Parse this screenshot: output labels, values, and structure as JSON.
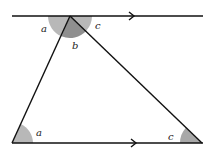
{
  "diagram": {
    "type": "geometry-parallel-lines-triangle",
    "colors": {
      "line": "#111111",
      "angle_light": "#b8b8b8",
      "angle_dark": "#8f8f8f",
      "background": "#ffffff"
    },
    "lines": [
      {
        "id": "top-parallel",
        "from": [
          12,
          16
        ],
        "to": [
          203,
          16
        ],
        "arrow_at": 133
      },
      {
        "id": "bottom-parallel",
        "from": [
          12,
          143
        ],
        "to": [
          203,
          143
        ],
        "arrow_at": 135
      }
    ],
    "triangle": {
      "apex": [
        70,
        16
      ],
      "bottom_left": [
        12,
        143
      ],
      "bottom_right": [
        202,
        143
      ]
    },
    "labels": {
      "top_left_angle": "a",
      "top_middle_angle": "b",
      "top_right_angle": "c",
      "bottom_left_angle": "a",
      "bottom_right_angle": "c"
    }
  }
}
